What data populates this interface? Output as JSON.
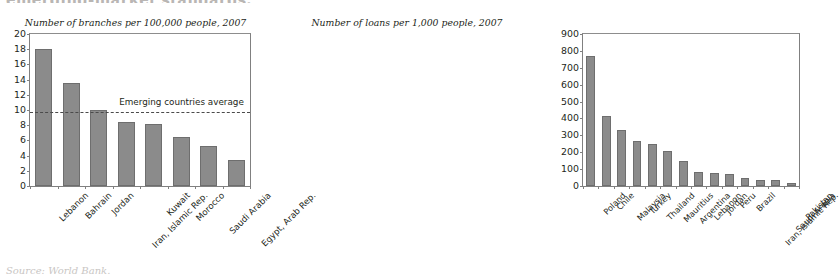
{
  "figure": {
    "cropped_top_text": "emerging-market standards.",
    "cropped_bottom_text": "Source: World Bank."
  },
  "chart_data": [
    {
      "type": "bar",
      "panel": "left",
      "title": "Number of branches per 100,000 people, 2007",
      "xlabel": "",
      "ylabel": "",
      "ylim": [
        0,
        20
      ],
      "ytick_values": [
        0,
        2,
        4,
        6,
        8,
        10,
        12,
        14,
        16,
        18,
        20
      ],
      "ytick_labels": [
        "0",
        "2",
        "4",
        "6",
        "8",
        "10",
        "12",
        "14",
        "16",
        "18",
        "20"
      ],
      "grid": false,
      "legend": "none",
      "bar_color": "#8b8b8b",
      "categories": [
        "Lebanon",
        "Bahrain",
        "Jordan",
        "Iran, Islamic Rep.",
        "Kuwait",
        "Morocco",
        "Saudi Arabia",
        "Egypt, Arab Rep."
      ],
      "values": [
        18.0,
        13.5,
        10.0,
        8.4,
        8.2,
        6.5,
        5.3,
        3.4
      ],
      "annotations": [
        {
          "type": "hline",
          "label": "Emerging countries average",
          "value": 9.8,
          "style": "dashed"
        }
      ]
    },
    {
      "type": "bar",
      "panel": "right",
      "title": "Number of loans per 1,000 people, 2007",
      "xlabel": "",
      "ylabel": "",
      "ylim": [
        0,
        900
      ],
      "ytick_values": [
        0,
        100,
        200,
        300,
        400,
        500,
        600,
        700,
        800,
        900
      ],
      "ytick_labels": [
        "0",
        "100",
        "200",
        "300",
        "400",
        "500",
        "600",
        "700",
        "800",
        "900"
      ],
      "grid": false,
      "legend": "none",
      "bar_color": "#8b8b8b",
      "categories": [
        "Poland",
        "Chile",
        "Malaysia",
        "Turkey",
        "Thailand",
        "Mauritius",
        "Argentina",
        "Lebanon",
        "Jordan",
        "Peru",
        "Brazil",
        "Iran, Islamic Rep.",
        "Saudi Arabia",
        "Pakistan"
      ],
      "values": [
        770,
        415,
        330,
        265,
        248,
        207,
        150,
        85,
        75,
        73,
        45,
        38,
        37,
        15
      ],
      "annotations": []
    }
  ]
}
